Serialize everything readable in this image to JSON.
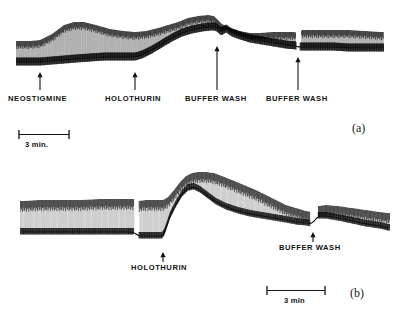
{
  "figure": {
    "kind": "kymograph-recording",
    "ink_color": "#141414",
    "background_color": "#ffffff",
    "panels": [
      {
        "id": "a",
        "id_label": "(a)",
        "event_markers": [
          {
            "name": "neostigmine",
            "label": "NEOSTIGMINE",
            "x": 40
          },
          {
            "name": "holothurin",
            "label": "HOLOTHURIN",
            "x": 135
          },
          {
            "name": "buffer-wash-1",
            "label": "BUFFER  WASH",
            "x": 217
          },
          {
            "name": "buffer-wash-2",
            "label": "BUFFER  WASH",
            "x": 298
          }
        ],
        "scale_bar": {
          "label": "3 min.",
          "x": 18,
          "y": 133,
          "length_px": 50
        }
      },
      {
        "id": "b",
        "id_label": "(b)",
        "event_markers": [
          {
            "name": "holothurin",
            "label": "HOLOTHURIN",
            "x": 163
          },
          {
            "name": "buffer-wash",
            "label": "BUFFER  WASH",
            "x": 313
          }
        ],
        "scale_bar": {
          "label": "3 min",
          "x": 266,
          "y": 288,
          "length_px": 58
        }
      }
    ]
  },
  "chart_data": {
    "type": "line",
    "title": "",
    "xlabel": "",
    "ylabel": "",
    "series": [
      {
        "name": "panel-a-upper-envelope",
        "panel": "a",
        "x": [
          18,
          30,
          40,
          52,
          64,
          74,
          84,
          96,
          110,
          124,
          135,
          146,
          158,
          168,
          178,
          188,
          198,
          208,
          214,
          217,
          222,
          230,
          240,
          250,
          260,
          272,
          284,
          294,
          298,
          302,
          314,
          330,
          348,
          366,
          382
        ],
        "y": [
          41,
          41,
          40,
          34,
          25,
          22,
          22,
          25,
          29,
          31,
          32,
          31,
          28,
          25,
          22,
          18,
          16,
          15,
          16,
          19,
          24,
          28,
          31,
          33,
          33,
          32,
          32,
          32,
          33,
          30,
          30,
          30,
          30,
          31,
          32
        ]
      },
      {
        "name": "panel-a-lower-baseline",
        "panel": "a",
        "x": [
          18,
          30,
          40,
          52,
          64,
          76,
          90,
          104,
          118,
          130,
          135,
          142,
          152,
          162,
          172,
          182,
          192,
          202,
          210,
          215,
          217,
          221,
          226,
          232,
          240,
          250,
          262,
          274,
          286,
          296,
          298,
          304,
          316,
          332,
          350,
          368,
          382
        ],
        "y": [
          62,
          62,
          62,
          61,
          60,
          59,
          58,
          57,
          57,
          57,
          57,
          55,
          50,
          44,
          38,
          33,
          30,
          28,
          27,
          27,
          28,
          32,
          29,
          33,
          36,
          39,
          41,
          43,
          45,
          46,
          47,
          47,
          47,
          47,
          48,
          48,
          48
        ]
      },
      {
        "name": "panel-b-upper-envelope",
        "panel": "b",
        "x": [
          22,
          40,
          60,
          80,
          100,
          120,
          134,
          138,
          146,
          152,
          158,
          163,
          168,
          174,
          180,
          186,
          192,
          198,
          206,
          214,
          222,
          232,
          244,
          256,
          266,
          276,
          286,
          296,
          306,
          312,
          318,
          326,
          338,
          352,
          366,
          380,
          388
        ],
        "y": [
          201,
          200,
          200,
          200,
          199,
          199,
          199,
          201,
          200,
          200,
          200,
          200,
          197,
          190,
          182,
          176,
          173,
          172,
          172,
          173,
          176,
          180,
          185,
          190,
          195,
          200,
          205,
          208,
          211,
          212,
          206,
          205,
          206,
          208,
          210,
          212,
          213
        ]
      },
      {
        "name": "panel-b-lower-baseline",
        "panel": "b",
        "x": [
          22,
          40,
          60,
          80,
          100,
          120,
          134,
          138,
          146,
          152,
          158,
          163,
          166,
          170,
          176,
          182,
          188,
          194,
          200,
          208,
          216,
          226,
          238,
          250,
          262,
          274,
          286,
          296,
          306,
          312,
          318,
          326,
          338,
          352,
          366,
          380,
          388
        ],
        "y": [
          232,
          232,
          232,
          232,
          232,
          232,
          232,
          236,
          236,
          236,
          236,
          236,
          228,
          216,
          204,
          194,
          188,
          187,
          190,
          196,
          202,
          207,
          211,
          214,
          216,
          218,
          220,
          222,
          223,
          224,
          216,
          216,
          218,
          221,
          224,
          226,
          228
        ]
      }
    ]
  }
}
